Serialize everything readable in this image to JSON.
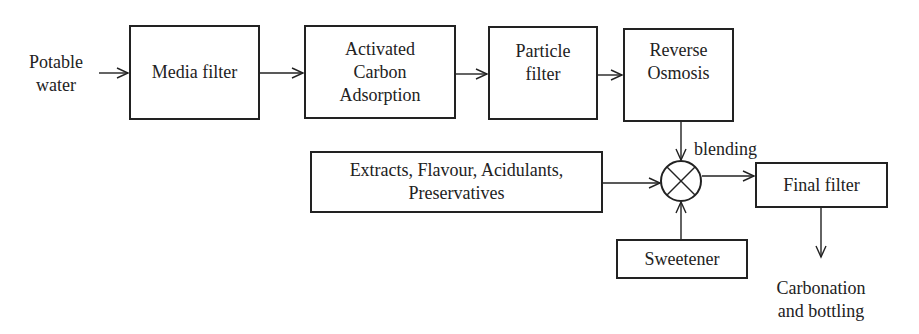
{
  "diagram": {
    "type": "process-flow",
    "input_label": "Potable\nwater",
    "nodes": {
      "media_filter": "Media filter",
      "activated_carbon": "Activated\nCarbon\nAdsorption",
      "particle_filter": "Particle\nfilter",
      "reverse_osmosis": "Reverse\nOsmosis",
      "additives": "Extracts, Flavour, Acidulants,\nPreservatives",
      "sweetener": "Sweetener",
      "final_filter": "Final filter"
    },
    "mixer_label": "blending",
    "output_label": "Carbonation\nand bottling",
    "edges": [
      {
        "from": "Potable water",
        "to": "Media filter"
      },
      {
        "from": "Media filter",
        "to": "Activated Carbon Adsorption"
      },
      {
        "from": "Activated Carbon Adsorption",
        "to": "Particle filter"
      },
      {
        "from": "Particle filter",
        "to": "Reverse Osmosis"
      },
      {
        "from": "Reverse Osmosis",
        "to": "blending mixer"
      },
      {
        "from": "Extracts, Flavour, Acidulants, Preservatives",
        "to": "blending mixer"
      },
      {
        "from": "Sweetener",
        "to": "blending mixer"
      },
      {
        "from": "blending mixer",
        "to": "Final filter"
      },
      {
        "from": "Final filter",
        "to": "Carbonation and bottling"
      }
    ],
    "colors": {
      "line": "#222222",
      "background": "#ffffff"
    }
  }
}
